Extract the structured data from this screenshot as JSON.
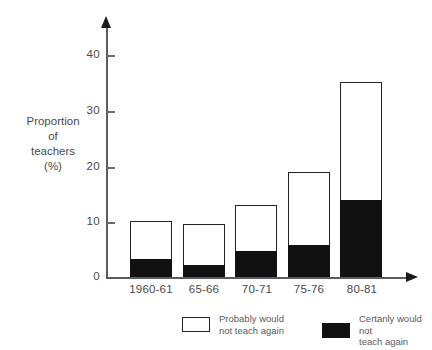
{
  "chart_data": {
    "type": "bar",
    "subtype": "stacked-vertical",
    "title": "",
    "xlabel": "",
    "ylabel": "Proportion of teachers (%)",
    "ylim": [
      0,
      40
    ],
    "yticks": [
      0,
      10,
      20,
      30,
      40
    ],
    "ytick_labels": [
      "0",
      "10",
      "20",
      "30",
      "40"
    ],
    "grid": false,
    "legend_position": "bottom",
    "categories": [
      "1960-61",
      "65-66",
      "70-71",
      "75-76",
      "80-81"
    ],
    "series": [
      {
        "name": "Certanly would not teach again",
        "color": "#111111",
        "values": [
          3.3,
          2.1,
          4.7,
          5.8,
          13.9
        ]
      },
      {
        "name": "Probably would not teach again",
        "color": "#ffffff",
        "values": [
          6.8,
          7.4,
          8.3,
          13.2,
          21.3
        ]
      }
    ],
    "totals": [
      10.1,
      9.5,
      13.0,
      19.0,
      35.2
    ]
  },
  "axis": {
    "y_title_lines": [
      "Proportion",
      "of",
      "teachers",
      "(%)"
    ],
    "y_tick_labels": [
      "40",
      "30",
      "20",
      "10",
      "0"
    ]
  },
  "legend": {
    "entries": [
      {
        "label": "Probably would\nnot teach again",
        "swatch": "light"
      },
      {
        "label": "Certanly would not\nteach again",
        "swatch": "dark"
      }
    ]
  },
  "colors": {
    "dark_segment": "#111111",
    "light_segment": "#ffffff",
    "outline": "#242424",
    "axis": "#5c5c5c",
    "text": "#4a4a4a",
    "background": "#ffffff"
  }
}
